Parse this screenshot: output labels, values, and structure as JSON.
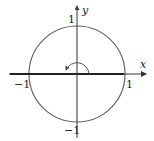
{
  "figure": {
    "type": "unit-circle-diagram",
    "axes": {
      "x_label": "x",
      "y_label": "y"
    },
    "ticks": {
      "x_pos": "1",
      "x_neg": "−1",
      "y_pos": "1",
      "y_neg": "−1"
    },
    "angle": {
      "description": "180-degree angle arc from positive x-axis to negative x-axis",
      "degrees": 180
    },
    "highlighted_ray": "terminal side along negative x-axis",
    "colors": {
      "circle": "#555555",
      "axes": "#333333",
      "ray": "#222222"
    }
  }
}
